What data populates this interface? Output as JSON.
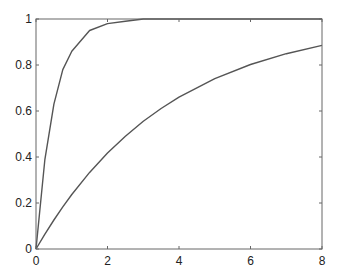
{
  "chart_data": {
    "type": "line",
    "title": "",
    "xlabel": "",
    "ylabel": "",
    "xlim": [
      0,
      8
    ],
    "ylim": [
      0,
      1
    ],
    "grid": false,
    "legend": null,
    "x_ticks": [
      0,
      2,
      4,
      6,
      8
    ],
    "x_tick_labels": [
      "0",
      "2",
      "4",
      "6",
      "8"
    ],
    "y_ticks": [
      0,
      0.2,
      0.4,
      0.6,
      0.8,
      1
    ],
    "y_tick_labels": [
      "0",
      "0.2",
      "0.4",
      "0.6",
      "0.8",
      "1"
    ],
    "x": [
      0,
      0.25,
      0.5,
      0.75,
      1,
      1.5,
      2,
      2.5,
      3,
      3.5,
      4,
      5,
      6,
      7,
      8
    ],
    "series": [
      {
        "name": "fast curve",
        "color": "#555555",
        "values": [
          0,
          0.39,
          0.63,
          0.78,
          0.86,
          0.95,
          0.98,
          0.99,
          1.0,
          1.0,
          1.0,
          1.0,
          1.0,
          1.0,
          1.0
        ]
      },
      {
        "name": "slow curve",
        "color": "#555555",
        "values": [
          0,
          0.065,
          0.126,
          0.183,
          0.237,
          0.333,
          0.417,
          0.49,
          0.555,
          0.611,
          0.66,
          0.741,
          0.802,
          0.849,
          0.885
        ]
      }
    ]
  }
}
